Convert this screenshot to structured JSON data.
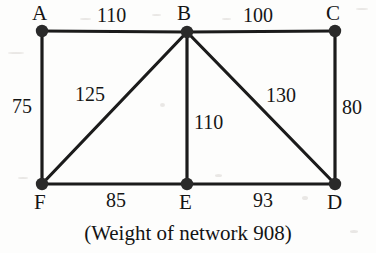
{
  "figure": {
    "caption": "(Weight of network 908)",
    "background_color": "#fdfdfc",
    "stroke_color": "#1b1b1b",
    "node_color": "#2a2a2a"
  },
  "chart_data": {
    "type": "diagram",
    "subtype": "weighted-undirected-graph",
    "title": "(Weight of network 908)",
    "total_weight": 908,
    "nodes": [
      {
        "id": "A",
        "label": "A",
        "x": 42,
        "y": 31,
        "label_x": 32,
        "label_y": 3
      },
      {
        "id": "B",
        "label": "B",
        "x": 187,
        "y": 32,
        "label_x": 177,
        "label_y": 3
      },
      {
        "id": "C",
        "label": "C",
        "x": 335,
        "y": 31,
        "label_x": 326,
        "label_y": 3
      },
      {
        "id": "D",
        "label": "D",
        "x": 335,
        "y": 184,
        "label_x": 327,
        "label_y": 192
      },
      {
        "id": "E",
        "label": "E",
        "x": 187,
        "y": 184,
        "label_x": 179,
        "label_y": 192
      },
      {
        "id": "F",
        "label": "F",
        "x": 42,
        "y": 184,
        "label_x": 34,
        "label_y": 192
      }
    ],
    "edges": [
      {
        "from": "A",
        "to": "B",
        "weight": 110,
        "label": "110",
        "label_x": 97,
        "label_y": 5
      },
      {
        "from": "B",
        "to": "C",
        "weight": 100,
        "label": "100",
        "label_x": 243,
        "label_y": 5
      },
      {
        "from": "A",
        "to": "F",
        "weight": 75,
        "label": "75",
        "label_x": 12,
        "label_y": 96
      },
      {
        "from": "B",
        "to": "F",
        "weight": 125,
        "label": "125",
        "label_x": 75,
        "label_y": 84
      },
      {
        "from": "B",
        "to": "E",
        "weight": 110,
        "label": "110",
        "label_x": 194,
        "label_y": 112
      },
      {
        "from": "B",
        "to": "D",
        "weight": 130,
        "label": "130",
        "label_x": 266,
        "label_y": 85
      },
      {
        "from": "C",
        "to": "D",
        "weight": 80,
        "label": "80",
        "label_x": 342,
        "label_y": 97
      },
      {
        "from": "F",
        "to": "E",
        "weight": 85,
        "label": "85",
        "label_x": 106,
        "label_y": 190
      },
      {
        "from": "E",
        "to": "D",
        "weight": 93,
        "label": "93",
        "label_x": 253,
        "label_y": 190
      }
    ]
  }
}
